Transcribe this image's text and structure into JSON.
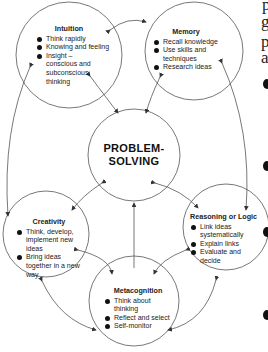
{
  "diagram": {
    "center": {
      "line1": "PROBLEM-",
      "line2": "SOLVING"
    },
    "nodes": {
      "intuition": {
        "title": "Intuition",
        "items": [
          "Think rapidly",
          "Knowing and feeling",
          "Insight – conscious and subconscious thinking"
        ]
      },
      "memory": {
        "title": "Memory",
        "items": [
          "Recall knowledge",
          "Use skills and techniques",
          "Research ideas"
        ]
      },
      "creativity": {
        "title": "Creativity",
        "items": [
          "Think, develop, implement new ideas",
          "Bring ideas together in a new way"
        ]
      },
      "reasoning": {
        "title": "Reasoning or Logic",
        "items": [
          "Link ideas systematically",
          "Explain links",
          "Evaluate and decide"
        ]
      },
      "metacognition": {
        "title": "Metacognition",
        "items": [
          "Think about thinking",
          "Reflect and select",
          "Self-monitor"
        ]
      }
    },
    "colors": {
      "stroke": "#555555",
      "text": "#222222",
      "background": "#ffffff"
    }
  },
  "side_fragment": {
    "letters": [
      "p",
      "g",
      "p",
      "a"
    ]
  }
}
